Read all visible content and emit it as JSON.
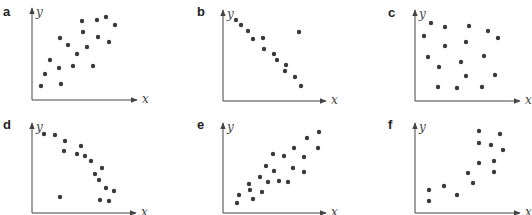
{
  "chart_data": [
    {
      "type": "scatter",
      "panel": "a",
      "xlabel": "x",
      "ylabel": "y",
      "trend": "positive correlation",
      "axes_px": {
        "origin": [
          32,
          100
        ],
        "x_end": 137,
        "y_top": 8
      },
      "points_px": [
        [
          41,
          86
        ],
        [
          45,
          74
        ],
        [
          50,
          60
        ],
        [
          59,
          68
        ],
        [
          60,
          38
        ],
        [
          61,
          84
        ],
        [
          68,
          45
        ],
        [
          73,
          66
        ],
        [
          77,
          54
        ],
        [
          82,
          21
        ],
        [
          83,
          32
        ],
        [
          87,
          47
        ],
        [
          93,
          66
        ],
        [
          97,
          20
        ],
        [
          98,
          37
        ],
        [
          106,
          17
        ],
        [
          109,
          42
        ],
        [
          115,
          25
        ]
      ]
    },
    {
      "type": "scatter",
      "panel": "b",
      "xlabel": "x",
      "ylabel": "y",
      "trend": "negative correlation with one outlier",
      "axes_px": {
        "origin": [
          223,
          101
        ],
        "x_end": 326,
        "y_top": 10
      },
      "points_px": [
        [
          236,
          20
        ],
        [
          241,
          25
        ],
        [
          248,
          31
        ],
        [
          253,
          39
        ],
        [
          263,
          38
        ],
        [
          264,
          49
        ],
        [
          274,
          54
        ],
        [
          277,
          60
        ],
        [
          286,
          65
        ],
        [
          285,
          71
        ],
        [
          295,
          77
        ],
        [
          299,
          32
        ],
        [
          301,
          86
        ]
      ]
    },
    {
      "type": "scatter",
      "panel": "c",
      "xlabel": "x",
      "ylabel": "y",
      "trend": "no correlation",
      "axes_px": {
        "origin": [
          415,
          101
        ],
        "x_end": 520,
        "y_top": 10
      },
      "points_px": [
        [
          431,
          23
        ],
        [
          424,
          36
        ],
        [
          445,
          27
        ],
        [
          469,
          26
        ],
        [
          488,
          31
        ],
        [
          498,
          38
        ],
        [
          445,
          46
        ],
        [
          466,
          42
        ],
        [
          428,
          57
        ],
        [
          461,
          62
        ],
        [
          484,
          56
        ],
        [
          439,
          67
        ],
        [
          466,
          76
        ],
        [
          495,
          75
        ],
        [
          438,
          87
        ],
        [
          457,
          88
        ],
        [
          482,
          87
        ]
      ]
    },
    {
      "type": "scatter",
      "panel": "d",
      "xlabel": "x",
      "ylabel": "y",
      "trend": "negative non-linear correlation with one outlier",
      "axes_px": {
        "origin": [
          32,
          213
        ],
        "x_end": 136,
        "y_top": 123
      },
      "points_px": [
        [
          44,
          134
        ],
        [
          55,
          135
        ],
        [
          65,
          141
        ],
        [
          64,
          151
        ],
        [
          77,
          154
        ],
        [
          81,
          146
        ],
        [
          85,
          156
        ],
        [
          91,
          161
        ],
        [
          102,
          168
        ],
        [
          95,
          174
        ],
        [
          99,
          180
        ],
        [
          106,
          188
        ],
        [
          114,
          191
        ],
        [
          60,
          197
        ],
        [
          100,
          200
        ],
        [
          109,
          201
        ]
      ]
    },
    {
      "type": "scatter",
      "panel": "e",
      "xlabel": "x",
      "ylabel": "y",
      "trend": "positive linear correlation",
      "axes_px": {
        "origin": [
          223,
          213
        ],
        "x_end": 326,
        "y_top": 123
      },
      "points_px": [
        [
          237,
          203
        ],
        [
          239,
          195
        ],
        [
          249,
          184
        ],
        [
          250,
          190
        ],
        [
          253,
          199
        ],
        [
          260,
          177
        ],
        [
          262,
          192
        ],
        [
          266,
          166
        ],
        [
          268,
          182
        ],
        [
          274,
          171
        ],
        [
          273,
          154
        ],
        [
          279,
          181
        ],
        [
          284,
          156
        ],
        [
          288,
          182
        ],
        [
          293,
          168
        ],
        [
          294,
          148
        ],
        [
          304,
          157
        ],
        [
          304,
          172
        ],
        [
          307,
          138
        ],
        [
          318,
          148
        ],
        [
          319,
          132
        ]
      ]
    },
    {
      "type": "scatter",
      "panel": "f",
      "xlabel": "x",
      "ylabel": "y",
      "trend": "positive non-linear correlation",
      "axes_px": {
        "origin": [
          415,
          213
        ],
        "x_end": 520,
        "y_top": 123
      },
      "points_px": [
        [
          429,
          190
        ],
        [
          429,
          201
        ],
        [
          444,
          186
        ],
        [
          457,
          195
        ],
        [
          468,
          173
        ],
        [
          473,
          183
        ],
        [
          479,
          131
        ],
        [
          479,
          143
        ],
        [
          479,
          163
        ],
        [
          491,
          145
        ],
        [
          494,
          161
        ],
        [
          494,
          172
        ],
        [
          500,
          134
        ],
        [
          503,
          150
        ]
      ]
    }
  ],
  "panels": [
    {
      "label": "a",
      "label_pos": [
        3,
        16
      ],
      "x_label": "x",
      "y_label": "y"
    },
    {
      "label": "b",
      "label_pos": [
        197,
        16
      ],
      "x_label": "x",
      "y_label": "y"
    },
    {
      "label": "c",
      "label_pos": [
        388,
        17
      ],
      "x_label": "x",
      "y_label": "y"
    },
    {
      "label": "d",
      "label_pos": [
        3,
        129
      ],
      "x_label": "x",
      "y_label": "y"
    },
    {
      "label": "e",
      "label_pos": [
        197,
        129
      ],
      "x_label": "x",
      "y_label": "y"
    },
    {
      "label": "f",
      "label_pos": [
        388,
        129
      ],
      "x_label": "x",
      "y_label": "y"
    }
  ],
  "colors": {
    "point": "#3a3a3a",
    "axis": "#444444",
    "label": "#222222"
  }
}
